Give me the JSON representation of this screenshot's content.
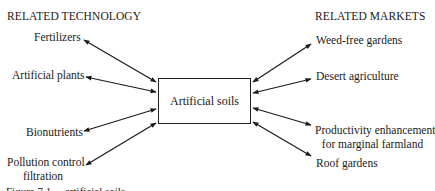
{
  "diagram": {
    "left_heading": "RELATED TECHNOLOGY",
    "right_heading": "RELATED MARKETS",
    "center_node": "Artificial soils",
    "technologies": [
      {
        "label": "Fertilizers"
      },
      {
        "label": "Artificial plants"
      },
      {
        "label": "Bionutrients"
      },
      {
        "label_line1": "Pollution control",
        "label_line2": "filtration"
      }
    ],
    "markets": [
      {
        "label": "Weed-free gardens"
      },
      {
        "label": "Desert agriculture"
      },
      {
        "label_line1": "Productivity enhancement",
        "label_line2": "for marginal farmland"
      },
      {
        "label": "Roof gardens"
      }
    ],
    "edges": [
      {
        "from": "Fertilizers",
        "to": "Artificial soils",
        "type": "bidirectional"
      },
      {
        "from": "Artificial plants",
        "to": "Artificial soils",
        "type": "bidirectional"
      },
      {
        "from": "Bionutrients",
        "to": "Artificial soils",
        "type": "bidirectional"
      },
      {
        "from": "Pollution control filtration",
        "to": "Artificial soils",
        "type": "bidirectional"
      },
      {
        "from": "Artificial soils",
        "to": "Weed-free gardens",
        "type": "bidirectional"
      },
      {
        "from": "Artificial soils",
        "to": "Desert agriculture",
        "type": "bidirectional"
      },
      {
        "from": "Artificial soils",
        "to": "Productivity enhancement for marginal farmland",
        "type": "bidirectional"
      },
      {
        "from": "Artificial soils",
        "to": "Roof gardens",
        "type": "bidirectional"
      }
    ],
    "caption": "Figure 7.1 ... artificial soils"
  }
}
